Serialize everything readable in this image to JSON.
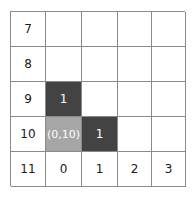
{
  "chart_data": {
    "type": "table",
    "title": "",
    "xlabel": "",
    "ylabel": "",
    "grid": true,
    "rows": 5,
    "columns": 5,
    "row_labels": [
      "7",
      "8",
      "9",
      "10",
      "11"
    ],
    "column_labels": [
      "0",
      "1",
      "2",
      "3"
    ],
    "colors": {
      "fill_dark": "#434343",
      "fill_gray": "#a6a6a6",
      "grid_line": "#8a8a8a",
      "cell_background": "#ffffff",
      "label_text": "#1a1a1a",
      "filled_text": "#ffffff"
    },
    "cells": [
      [
        {
          "text": "7",
          "fill": "none",
          "name": "row-label-7"
        },
        {
          "text": "",
          "fill": "none",
          "name": "cell-r7-c0"
        },
        {
          "text": "",
          "fill": "none",
          "name": "cell-r7-c1"
        },
        {
          "text": "",
          "fill": "none",
          "name": "cell-r7-c2"
        },
        {
          "text": "",
          "fill": "none",
          "name": "cell-r7-c3"
        }
      ],
      [
        {
          "text": "8",
          "fill": "none",
          "name": "row-label-8"
        },
        {
          "text": "",
          "fill": "none",
          "name": "cell-r8-c0"
        },
        {
          "text": "",
          "fill": "none",
          "name": "cell-r8-c1"
        },
        {
          "text": "",
          "fill": "none",
          "name": "cell-r8-c2"
        },
        {
          "text": "",
          "fill": "none",
          "name": "cell-r8-c3"
        }
      ],
      [
        {
          "text": "9",
          "fill": "none",
          "name": "row-label-9"
        },
        {
          "text": "1",
          "fill": "dark",
          "name": "cell-r9-c0"
        },
        {
          "text": "",
          "fill": "none",
          "name": "cell-r9-c1"
        },
        {
          "text": "",
          "fill": "none",
          "name": "cell-r9-c2"
        },
        {
          "text": "",
          "fill": "none",
          "name": "cell-r9-c3"
        }
      ],
      [
        {
          "text": "10",
          "fill": "none",
          "name": "row-label-10"
        },
        {
          "text": "(0,10)",
          "fill": "gray",
          "name": "cell-r10-c0"
        },
        {
          "text": "1",
          "fill": "dark",
          "name": "cell-r10-c1"
        },
        {
          "text": "",
          "fill": "none",
          "name": "cell-r10-c2"
        },
        {
          "text": "",
          "fill": "none",
          "name": "cell-r10-c3"
        }
      ],
      [
        {
          "text": "11",
          "fill": "none",
          "name": "row-label-11"
        },
        {
          "text": "0",
          "fill": "none",
          "name": "column-label-0"
        },
        {
          "text": "1",
          "fill": "none",
          "name": "column-label-1"
        },
        {
          "text": "2",
          "fill": "none",
          "name": "column-label-2"
        },
        {
          "text": "3",
          "fill": "none",
          "name": "column-label-3"
        }
      ]
    ]
  }
}
